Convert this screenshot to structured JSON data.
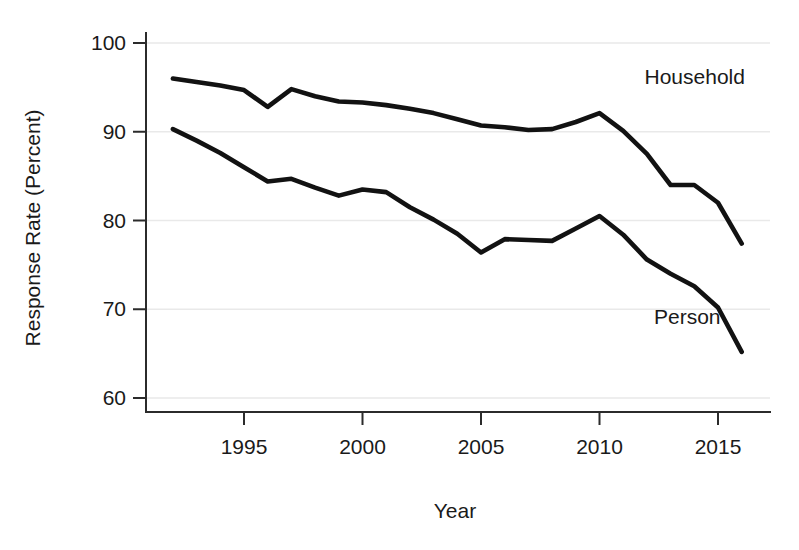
{
  "chart_data": {
    "type": "line",
    "title": "",
    "xlabel": "Year",
    "ylabel": "Response Rate (Percent)",
    "xlim": [
      1992,
      2016.8
    ],
    "ylim": [
      58,
      100
    ],
    "grid": true,
    "grid_axis": "y",
    "legend": "inline-labels",
    "x_ticks": [
      1995,
      2000,
      2005,
      2010,
      2015
    ],
    "x_tick_labels": [
      "1995",
      "2000",
      "2005",
      "2010",
      "2015"
    ],
    "y_ticks": [
      60,
      70,
      80,
      90,
      100
    ],
    "y_tick_labels": [
      "60",
      "70",
      "80",
      "90",
      "100"
    ],
    "x": [
      1992,
      1993,
      1994,
      1995,
      1996,
      1997,
      1998,
      1999,
      2000,
      2001,
      2002,
      2003,
      2004,
      2005,
      2006,
      2007,
      2008,
      2009,
      2010,
      2011,
      2012,
      2013,
      2014,
      2015,
      2016
    ],
    "series": [
      {
        "name": "Household",
        "label": "Household",
        "color": "#121212",
        "values": [
          96.0,
          95.6,
          95.2,
          94.7,
          92.8,
          94.8,
          94.0,
          93.4,
          93.3,
          93.0,
          92.6,
          92.1,
          91.4,
          90.7,
          90.5,
          90.2,
          90.3,
          91.1,
          92.1,
          90.1,
          87.5,
          84.0,
          84.0,
          82.0,
          77.4
        ]
      },
      {
        "name": "Person",
        "label": "Person",
        "color": "#121212",
        "values": [
          90.3,
          89.0,
          87.6,
          86.0,
          84.4,
          84.7,
          83.7,
          82.8,
          83.5,
          83.2,
          81.5,
          80.1,
          78.5,
          76.4,
          77.9,
          77.8,
          77.7,
          79.1,
          80.5,
          78.4,
          75.6,
          74.0,
          72.6,
          70.2,
          65.2
        ]
      }
    ],
    "annotations": [
      {
        "text": "Household",
        "x": 2011.9,
        "y": 95.4,
        "anchor": "start"
      },
      {
        "text": "Person",
        "x": 2012.3,
        "y": 68.3,
        "anchor": "start"
      }
    ]
  }
}
